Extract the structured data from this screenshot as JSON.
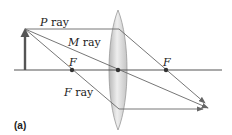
{
  "diagram": {
    "caption": "(a)",
    "labels": {
      "p_ray_var": "P",
      "p_ray_word": " ray",
      "m_ray_var": "M",
      "m_ray_word": " ray",
      "f_ray_var": "F",
      "f_ray_word": " ray",
      "focal_left": "F",
      "focal_right": "F"
    },
    "elements": [
      {
        "name": "object-arrow",
        "type": "arrow"
      },
      {
        "name": "optical-axis",
        "type": "line"
      },
      {
        "name": "converging-lens",
        "type": "lens"
      },
      {
        "name": "p-ray",
        "type": "ray"
      },
      {
        "name": "m-ray",
        "type": "ray"
      },
      {
        "name": "f-ray",
        "type": "ray"
      },
      {
        "name": "focal-point-left",
        "type": "point"
      },
      {
        "name": "focal-point-right",
        "type": "point"
      },
      {
        "name": "lens-center",
        "type": "point"
      }
    ],
    "colors": {
      "axis": "#555555",
      "ray": "#666666",
      "object": "#555555",
      "lens_fill": "#d8d8d8",
      "lens_edge": "#9a9a9a"
    }
  }
}
